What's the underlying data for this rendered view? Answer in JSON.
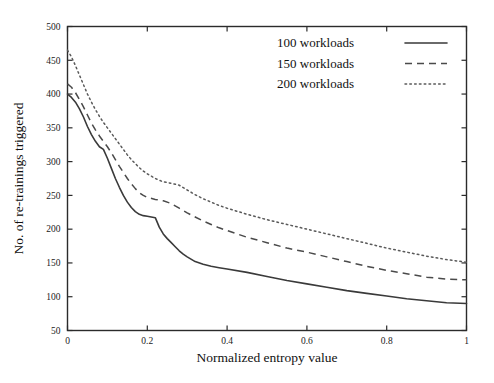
{
  "chart_data": {
    "type": "line",
    "title": "",
    "xlabel": "Normalized entropy value",
    "ylabel": "No. of re-trainings triggered",
    "xlim": [
      0,
      1
    ],
    "ylim": [
      50,
      500
    ],
    "xticks": [
      "0",
      "0.2",
      "0.4",
      "0.6",
      "0.8",
      "1"
    ],
    "xtick_values": [
      0,
      0.2,
      0.4,
      0.6,
      0.8,
      1
    ],
    "yticks": [
      "50",
      "100",
      "150",
      "200",
      "250",
      "300",
      "350",
      "400",
      "450",
      "500"
    ],
    "ytick_values": [
      50,
      100,
      150,
      200,
      250,
      300,
      350,
      400,
      450,
      500
    ],
    "grid": false,
    "legend_position": "top-right",
    "series": [
      {
        "name": "100 workloads",
        "style": "solid",
        "color": "#3a3a3a",
        "x": [
          0.0,
          0.01,
          0.02,
          0.03,
          0.04,
          0.05,
          0.06,
          0.07,
          0.08,
          0.09,
          0.1,
          0.11,
          0.12,
          0.13,
          0.14,
          0.15,
          0.16,
          0.17,
          0.18,
          0.19,
          0.2,
          0.21,
          0.22,
          0.23,
          0.24,
          0.25,
          0.26,
          0.27,
          0.28,
          0.29,
          0.3,
          0.32,
          0.34,
          0.36,
          0.38,
          0.4,
          0.45,
          0.5,
          0.55,
          0.6,
          0.65,
          0.7,
          0.75,
          0.8,
          0.85,
          0.9,
          0.95,
          1.0
        ],
        "y": [
          400,
          395,
          388,
          378,
          366,
          352,
          340,
          330,
          322,
          318,
          305,
          290,
          275,
          262,
          250,
          240,
          232,
          226,
          222,
          220,
          219,
          218,
          217,
          203,
          193,
          186,
          180,
          174,
          168,
          163,
          159,
          152,
          148,
          145,
          143,
          141,
          136,
          130,
          124,
          119,
          114,
          109,
          105,
          101,
          97,
          94,
          91,
          90
        ]
      },
      {
        "name": "150 workloads",
        "style": "dashed",
        "color": "#4a4a4a",
        "x": [
          0.0,
          0.01,
          0.02,
          0.03,
          0.04,
          0.05,
          0.06,
          0.07,
          0.08,
          0.09,
          0.1,
          0.11,
          0.12,
          0.13,
          0.14,
          0.15,
          0.16,
          0.17,
          0.18,
          0.19,
          0.2,
          0.22,
          0.24,
          0.26,
          0.28,
          0.3,
          0.32,
          0.34,
          0.36,
          0.38,
          0.4,
          0.45,
          0.5,
          0.55,
          0.6,
          0.65,
          0.7,
          0.75,
          0.8,
          0.85,
          0.9,
          0.95,
          1.0
        ],
        "y": [
          415,
          410,
          402,
          392,
          381,
          369,
          357,
          347,
          338,
          330,
          322,
          313,
          303,
          293,
          284,
          275,
          267,
          260,
          254,
          250,
          247,
          244,
          242,
          238,
          231,
          224,
          218,
          212,
          207,
          202,
          198,
          188,
          180,
          172,
          166,
          159,
          152,
          145,
          139,
          134,
          129,
          126,
          125
        ]
      },
      {
        "name": "200 workloads",
        "style": "dotted",
        "color": "#5a5a5a",
        "x": [
          0.0,
          0.01,
          0.02,
          0.03,
          0.04,
          0.05,
          0.06,
          0.07,
          0.08,
          0.09,
          0.1,
          0.11,
          0.12,
          0.13,
          0.14,
          0.15,
          0.16,
          0.17,
          0.18,
          0.19,
          0.2,
          0.22,
          0.24,
          0.26,
          0.28,
          0.3,
          0.32,
          0.34,
          0.36,
          0.38,
          0.4,
          0.45,
          0.5,
          0.55,
          0.6,
          0.65,
          0.7,
          0.75,
          0.8,
          0.85,
          0.9,
          0.95,
          1.0
        ],
        "y": [
          465,
          455,
          442,
          428,
          414,
          400,
          388,
          377,
          367,
          358,
          350,
          342,
          334,
          326,
          318,
          310,
          303,
          297,
          291,
          286,
          282,
          275,
          270,
          268,
          265,
          258,
          251,
          245,
          240,
          235,
          231,
          222,
          214,
          207,
          200,
          193,
          186,
          179,
          172,
          166,
          160,
          155,
          151
        ]
      }
    ]
  },
  "legend": {
    "entries": [
      {
        "label": "100 workloads",
        "style": "solid"
      },
      {
        "label": "150 workloads",
        "style": "dashed"
      },
      {
        "label": "200 workloads",
        "style": "dotted"
      }
    ]
  }
}
